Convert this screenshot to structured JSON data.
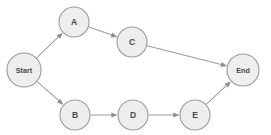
{
  "diagram": {
    "title": "",
    "type": "flowchart",
    "background_color": "#ffffff",
    "node_fill_color": "#eeeeee",
    "node_stroke_color": "#9a9a9a",
    "edge_color": "#9e9e9e",
    "label_color": "#4a4a4a",
    "nodes": [
      {
        "id": "start",
        "label": "Start",
        "cx": 24,
        "cy": 70,
        "r": 17,
        "label_size": "small"
      },
      {
        "id": "a",
        "label": "A",
        "cx": 74,
        "cy": 22,
        "r": 15,
        "label_size": "normal"
      },
      {
        "id": "c",
        "label": "C",
        "cx": 132,
        "cy": 42,
        "r": 15,
        "label_size": "normal"
      },
      {
        "id": "end",
        "label": "End",
        "cx": 243,
        "cy": 70,
        "r": 16,
        "label_size": "small"
      },
      {
        "id": "b",
        "label": "B",
        "cx": 75,
        "cy": 115,
        "r": 15,
        "label_size": "normal"
      },
      {
        "id": "d",
        "label": "D",
        "cx": 133,
        "cy": 115,
        "r": 15,
        "label_size": "normal"
      },
      {
        "id": "e",
        "label": "E",
        "cx": 195,
        "cy": 115,
        "r": 15,
        "label_size": "normal"
      }
    ],
    "edges": [
      {
        "id": "start-a",
        "from": "start",
        "to": "a",
        "label": ""
      },
      {
        "id": "a-c",
        "from": "a",
        "to": "c",
        "label": ""
      },
      {
        "id": "c-end",
        "from": "c",
        "to": "end",
        "label": ""
      },
      {
        "id": "start-b",
        "from": "start",
        "to": "b",
        "label": ""
      },
      {
        "id": "b-d",
        "from": "b",
        "to": "d",
        "label": ""
      },
      {
        "id": "d-e",
        "from": "d",
        "to": "e",
        "label": ""
      },
      {
        "id": "e-end",
        "from": "e",
        "to": "end",
        "label": ""
      }
    ]
  }
}
